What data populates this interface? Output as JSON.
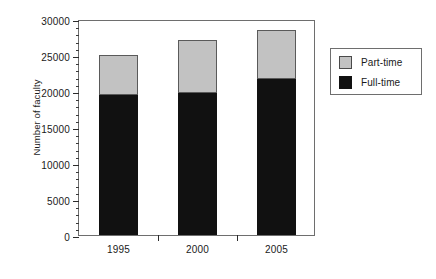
{
  "chart_data": {
    "type": "bar",
    "stacked": true,
    "title": "",
    "xlabel": "",
    "ylabel": "Number of faculty",
    "categories": [
      "1995",
      "2000",
      "2005"
    ],
    "series": [
      {
        "name": "Full-time",
        "color": "#111111",
        "values": [
          19500,
          19700,
          21700
        ]
      },
      {
        "name": "Part-time",
        "color": "#c2c2c2",
        "values": [
          5500,
          7400,
          6800
        ]
      }
    ],
    "totals": [
      25000,
      27100,
      28500
    ],
    "ylim": [
      0,
      30000
    ],
    "y_major_ticks": [
      0,
      5000,
      10000,
      15000,
      20000,
      25000,
      30000
    ],
    "y_tick_labels": [
      "0",
      "5000",
      "10000",
      "15000",
      "20000",
      "25000",
      "30000"
    ],
    "y_minor_tick_interval": 1000,
    "grid": false,
    "legend": {
      "position": "right",
      "entries": [
        {
          "label": "Part-time",
          "color": "#c2c2c2"
        },
        {
          "label": "Full-time",
          "color": "#111111"
        }
      ]
    }
  }
}
